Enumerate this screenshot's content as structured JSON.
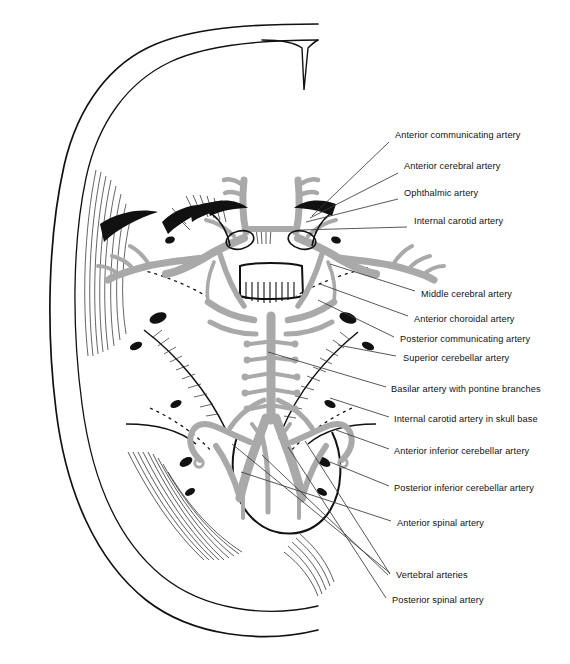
{
  "figure": {
    "kind": "anatomical-diagram",
    "background_color": "#ffffff",
    "artery_color": "#a9a9a9",
    "outline_color": "#111111",
    "leader_color": "#3a3a3a"
  },
  "labels": [
    {
      "id": "anterior-communicating-artery",
      "text": "Anterior communicating artery",
      "x": 395,
      "y": 136,
      "leader": [
        389,
        142,
        312,
        216
      ]
    },
    {
      "id": "anterior-cerebral-artery",
      "text": "Anterior cerebral artery",
      "x": 404,
      "y": 167,
      "leader": [
        398,
        173,
        310,
        218
      ]
    },
    {
      "id": "ophthalmic-artery",
      "text": "Ophthalmic artery",
      "x": 404,
      "y": 194,
      "leader": [
        398,
        199,
        306,
        222
      ]
    },
    {
      "id": "internal-carotid-artery",
      "text": "Internal carotid artery",
      "x": 414,
      "y": 222,
      "leader": [
        407,
        227,
        300,
        230
      ]
    },
    {
      "id": "middle-cerebral-artery",
      "text": "Middle cerebral artery",
      "x": 421,
      "y": 295,
      "leader": [
        415,
        291,
        330,
        264
      ]
    },
    {
      "id": "anterior-choroidal-artery",
      "text": "Anterior choroidal artery",
      "x": 414,
      "y": 320,
      "leader": [
        408,
        316,
        320,
        284
      ]
    },
    {
      "id": "posterior-communicating-artery",
      "text": "Posterior communicating artery",
      "x": 400,
      "y": 340,
      "leader": [
        394,
        337,
        318,
        300
      ]
    },
    {
      "id": "superior-cerebellar-artery",
      "text": "Superior cerebellar artery",
      "x": 403,
      "y": 359,
      "leader": [
        396,
        356,
        338,
        345
      ]
    },
    {
      "id": "basilar-artery-with-pontine-branches",
      "text": "Basilar artery with pontine branches",
      "x": 391,
      "y": 390,
      "leader": [
        386,
        387,
        268,
        352
      ]
    },
    {
      "id": "internal-carotid-artery-in-skull-base",
      "text": "Internal carotid artery in skull base",
      "x": 394,
      "y": 420,
      "leader": [
        389,
        417,
        330,
        398
      ]
    },
    {
      "id": "anterior-inferior-cerebellar-artery",
      "text": "Anterior inferior cerebellar artery",
      "x": 394,
      "y": 452,
      "leader": [
        389,
        449,
        336,
        430
      ]
    },
    {
      "id": "posterior-inferior-cerebellar-artery",
      "text": "Posterior inferior cerebellar artery",
      "x": 394,
      "y": 489,
      "leader": [
        389,
        486,
        330,
        462
      ]
    },
    {
      "id": "anterior-spinal-artery",
      "text": "Anterior spinal artery",
      "x": 397,
      "y": 524,
      "leader": [
        391,
        521,
        241,
        472
      ]
    },
    {
      "id": "vertebral-arteries",
      "text": "Vertebral arteries",
      "x": 396,
      "y": 576,
      "leader": [
        390,
        573,
        232,
        444
      ]
    },
    {
      "id": "posterior-spinal-artery",
      "text": "Posterior spinal artery",
      "x": 392,
      "y": 601,
      "leader": [
        386,
        598,
        288,
        447
      ]
    }
  ],
  "extra_leaders": [
    [
      390,
      574,
      305,
      441
    ],
    [
      388,
      575,
      262,
      455
    ]
  ]
}
